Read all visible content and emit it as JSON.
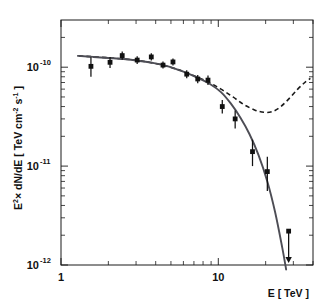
{
  "figure": {
    "background_color": "#ffffff",
    "frame_color": "#1a1a1a"
  },
  "axes": {
    "x": {
      "title": "E [ TeV ]",
      "scale": "log",
      "range": [
        1.0,
        40.0
      ],
      "major_ticks": [
        {
          "value": 1,
          "label": "1"
        },
        {
          "value": 10,
          "label": "10"
        }
      ],
      "minor_ticks": [
        2,
        3,
        4,
        5,
        6,
        7,
        8,
        9,
        20,
        30,
        40
      ]
    },
    "y": {
      "title_main": "E",
      "title_sup": "2",
      "title_rest": "× dN/dE [ TeV cm",
      "title_sup2": "-2",
      "title_mid": " s",
      "title_sup3": "-1",
      "title_end": " ]",
      "title_plain": "E2 × dN/dE [ TeV cm-2 s-1 ]",
      "scale": "log",
      "range": [
        1e-12,
        3e-10
      ],
      "major_ticks": [
        {
          "value": 1e-10,
          "mantissa": "10",
          "exponent": "-10"
        },
        {
          "value": 1e-11,
          "mantissa": "10",
          "exponent": "-11"
        },
        {
          "value": 1e-12,
          "mantissa": "10",
          "exponent": "-12"
        }
      ]
    }
  },
  "chart_data": {
    "type": "scatter",
    "title": "",
    "xlabel": "E [ TeV ]",
    "ylabel": "E2 x dN/dE [ TeV cm-2 s-1 ]",
    "xscale": "log",
    "yscale": "log",
    "xlim": [
      1.0,
      40.0
    ],
    "ylim": [
      1e-12,
      3e-10
    ],
    "grid": false,
    "legend": "none",
    "series": [
      {
        "name": "measured spectral points",
        "type": "scatter",
        "marker": "square",
        "color": "#111111",
        "points": [
          {
            "x": 1.55,
            "y": 1.02e-10,
            "yerr_low": 2.2e-11,
            "yerr_high": 2.4e-11
          },
          {
            "x": 2.05,
            "y": 1.12e-10,
            "yerr_low": 1.4e-11,
            "yerr_high": 1.5e-11
          },
          {
            "x": 2.45,
            "y": 1.31e-10,
            "yerr_low": 1.2e-11,
            "yerr_high": 1.3e-11
          },
          {
            "x": 3.05,
            "y": 1.18e-10,
            "yerr_low": 1e-11,
            "yerr_high": 1.1e-11
          },
          {
            "x": 3.75,
            "y": 1.27e-10,
            "yerr_low": 1e-11,
            "yerr_high": 1.1e-11
          },
          {
            "x": 4.45,
            "y": 1.05e-10,
            "yerr_low": 8e-12,
            "yerr_high": 9e-12
          },
          {
            "x": 5.15,
            "y": 1.13e-10,
            "yerr_low": 9e-12,
            "yerr_high": 9.5e-12
          },
          {
            "x": 6.3,
            "y": 8.5e-11,
            "yerr_low": 7.5e-12,
            "yerr_high": 8e-12
          },
          {
            "x": 7.4,
            "y": 7.6e-11,
            "yerr_low": 7e-12,
            "yerr_high": 7.5e-12
          },
          {
            "x": 8.6,
            "y": 7.4e-11,
            "yerr_low": 8e-12,
            "yerr_high": 8.5e-12
          },
          {
            "x": 10.6,
            "y": 4e-11,
            "yerr_low": 6e-12,
            "yerr_high": 6.5e-12
          },
          {
            "x": 12.8,
            "y": 3e-11,
            "yerr_low": 6e-12,
            "yerr_high": 6.5e-12
          },
          {
            "x": 16.5,
            "y": 1.4e-11,
            "yerr_low": 4e-12,
            "yerr_high": 4.5e-12
          },
          {
            "x": 20.5,
            "y": 8.8e-12,
            "yerr_low": 3.2e-12,
            "yerr_high": 3.6e-12
          }
        ]
      },
      {
        "name": "upper limit",
        "type": "upper_limit",
        "color": "#111111",
        "points": [
          {
            "x": 28.0,
            "y": 2.2e-12
          }
        ]
      },
      {
        "name": "fitted spectrum (solid)",
        "type": "line",
        "style": "solid",
        "color": "#4d4d55",
        "points": [
          {
            "x": 1.28,
            "y": 1.3e-10
          },
          {
            "x": 1.6,
            "y": 1.27e-10
          },
          {
            "x": 2.0,
            "y": 1.24e-10
          },
          {
            "x": 2.5,
            "y": 1.21e-10
          },
          {
            "x": 3.1,
            "y": 1.16e-10
          },
          {
            "x": 3.9,
            "y": 1.1e-10
          },
          {
            "x": 4.8,
            "y": 1.02e-10
          },
          {
            "x": 6.0,
            "y": 9e-11
          },
          {
            "x": 7.4,
            "y": 7.8e-11
          },
          {
            "x": 8.8,
            "y": 6.8e-11
          },
          {
            "x": 10.4,
            "y": 5.6e-11
          },
          {
            "x": 12.0,
            "y": 4.3e-11
          },
          {
            "x": 13.8,
            "y": 3.1e-11
          },
          {
            "x": 15.8,
            "y": 2.1e-11
          },
          {
            "x": 18.0,
            "y": 1.3e-11
          },
          {
            "x": 20.5,
            "y": 7e-12
          },
          {
            "x": 23.0,
            "y": 3.4e-12
          },
          {
            "x": 25.5,
            "y": 1.5e-12
          },
          {
            "x": 27.0,
            "y": 9e-13
          }
        ]
      },
      {
        "name": "alternative model (dashed)",
        "type": "line",
        "style": "dashed",
        "color": "#1a1a1a",
        "points": [
          {
            "x": 1.3,
            "y": 1.3e-10
          },
          {
            "x": 2.0,
            "y": 1.245e-10
          },
          {
            "x": 3.0,
            "y": 1.175e-10
          },
          {
            "x": 4.2,
            "y": 1.07e-10
          },
          {
            "x": 5.6,
            "y": 9.4e-11
          },
          {
            "x": 7.0,
            "y": 8.2e-11
          },
          {
            "x": 8.6,
            "y": 7.1e-11
          },
          {
            "x": 10.4,
            "y": 6e-11
          },
          {
            "x": 12.4,
            "y": 5e-11
          },
          {
            "x": 14.5,
            "y": 4.2e-11
          },
          {
            "x": 17.0,
            "y": 3.7e-11
          },
          {
            "x": 19.5,
            "y": 3.5e-11
          },
          {
            "x": 22.0,
            "y": 3.55e-11
          },
          {
            "x": 25.0,
            "y": 4e-11
          },
          {
            "x": 28.5,
            "y": 4.9e-11
          },
          {
            "x": 32.0,
            "y": 6e-11
          },
          {
            "x": 35.5,
            "y": 7e-11
          },
          {
            "x": 38.5,
            "y": 7.7e-11
          }
        ]
      }
    ]
  }
}
